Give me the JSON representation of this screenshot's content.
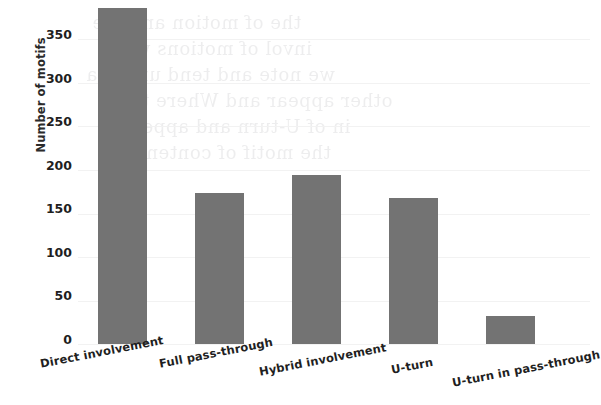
{
  "chart_data": {
    "type": "bar",
    "title": "",
    "subtitle": "",
    "xlabel": "",
    "ylabel": "Number of motifs",
    "categories": [
      "Direct involvement",
      "Full pass-through",
      "Hybrid involvement",
      "U-turn",
      "U-turn in pass-through"
    ],
    "values": [
      350,
      157,
      176,
      152,
      29
    ],
    "ylim": [
      0,
      350
    ],
    "yticks": [
      0,
      50,
      100,
      150,
      200,
      250,
      300,
      350
    ],
    "ytick_labels": [
      "0",
      "50",
      "100",
      "150",
      "200",
      "250",
      "300",
      "350"
    ],
    "grid": true,
    "legend": null,
    "bar_color": "#737373",
    "grid_color": "#f2f2f2",
    "background_color": "#ffffff",
    "annotations": []
  },
  "ghost_text": {
    "note": "faint show-through text from reverse of scanned page",
    "lines": [
      "the of motion and the",
      "invol of motions with",
      "we note and tend under a",
      "other appear and Where the",
      "in of U-turn and appeared",
      "the motif of content"
    ]
  }
}
